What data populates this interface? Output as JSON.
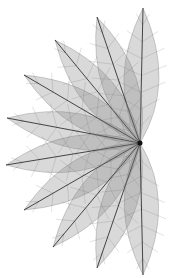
{
  "image": {
    "subject": "Fan of skeletal leaves radiating from a single point",
    "background": "#ffffff",
    "leaf_fill": "#8a8a8a",
    "vein_color": "#1e1e1e",
    "pivot": [
      140,
      143
    ],
    "leaves": [
      {
        "tip": [
          143,
          8
        ]
      },
      {
        "tip": [
          97,
          17
        ]
      },
      {
        "tip": [
          55,
          40
        ]
      },
      {
        "tip": [
          24,
          75
        ]
      },
      {
        "tip": [
          7,
          118
        ]
      },
      {
        "tip": [
          6,
          165
        ]
      },
      {
        "tip": [
          24,
          210
        ]
      },
      {
        "tip": [
          53,
          247
        ]
      },
      {
        "tip": [
          97,
          268
        ]
      },
      {
        "tip": [
          143,
          275
        ]
      }
    ]
  }
}
